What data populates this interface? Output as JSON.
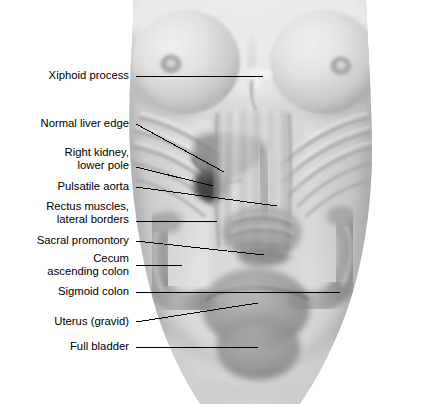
{
  "figure": {
    "type": "anatomical-illustration",
    "view": "anterior",
    "background_color": "#ffffff",
    "style": "grayscale airbrush medical illustration with translucent overlay of internal organs",
    "width": 431,
    "height": 404
  },
  "palette": {
    "background": "#ffffff",
    "skin_light": "#ededed",
    "skin_mid": "#d9d9d9",
    "skin_shadow": "#b9b9b9",
    "skin_deep_shadow": "#9a9a9a",
    "organ_overlay": "#a8a8a8",
    "organ_dark": "#6e6e6e",
    "kidney_dark": "#3a3a3a",
    "bone_highlight": "#f4f4f4",
    "areola": "#b0b0b0",
    "leader_line": "#000000",
    "label_text": "#000000"
  },
  "labels": [
    {
      "id": "xiphoid-process",
      "text": "Xiphoid process",
      "lines": [
        "Xiphoid process"
      ],
      "text_anchor_x": 129,
      "text_anchor_y": 69,
      "leader": {
        "x1": 136,
        "y1": 76,
        "x2": 263,
        "y2": 76
      },
      "target": "Xiphoid process of the sternum"
    },
    {
      "id": "normal-liver-edge",
      "text": "Normal liver edge",
      "lines": [
        "Normal liver edge"
      ],
      "text_anchor_x": 129,
      "text_anchor_y": 117,
      "leader": {
        "x1": 136,
        "y1": 124,
        "x2": 224,
        "y2": 172
      },
      "target": "Inferior border of the liver"
    },
    {
      "id": "right-kidney-lower-pole",
      "text": "Right kidney,\nlower pole",
      "lines": [
        "Right kidney,",
        "lower pole"
      ],
      "text_anchor_x": 129,
      "text_anchor_y": 146,
      "leader": {
        "x1": 136,
        "y1": 167,
        "x2": 213,
        "y2": 186
      },
      "target": "Lower pole of the right kidney"
    },
    {
      "id": "pulsatile-aorta",
      "text": "Pulsatile aorta",
      "lines": [
        "Pulsatile aorta"
      ],
      "text_anchor_x": 129,
      "text_anchor_y": 180,
      "leader": {
        "x1": 136,
        "y1": 187,
        "x2": 277,
        "y2": 206
      },
      "target": "Abdominal aorta"
    },
    {
      "id": "rectus-muscles-lateral-borders",
      "text": "Rectus muscles,\nlateral borders",
      "lines": [
        "Rectus muscles,",
        "lateral borders"
      ],
      "text_anchor_x": 129,
      "text_anchor_y": 200,
      "leader": {
        "x1": 136,
        "y1": 221,
        "x2": 217,
        "y2": 221
      },
      "target": "Lateral borders of the rectus abdominis muscles"
    },
    {
      "id": "sacral-promontory",
      "text": "Sacral promontory",
      "lines": [
        "Sacral promontory"
      ],
      "text_anchor_x": 129,
      "text_anchor_y": 234,
      "leader": {
        "x1": 136,
        "y1": 241,
        "x2": 264,
        "y2": 255
      },
      "target": "Sacral promontory"
    },
    {
      "id": "cecum-ascending-colon",
      "text": "Cecum\nascending colon",
      "lines": [
        "Cecum",
        "ascending colon"
      ],
      "text_anchor_x": 129,
      "text_anchor_y": 252,
      "leader": {
        "x1": 136,
        "y1": 265,
        "x2": 182,
        "y2": 265
      },
      "target": "Cecum and ascending colon"
    },
    {
      "id": "sigmoid-colon",
      "text": "Sigmoid colon",
      "lines": [
        "Sigmoid colon"
      ],
      "text_anchor_x": 129,
      "text_anchor_y": 285,
      "leader": {
        "x1": 136,
        "y1": 292,
        "x2": 340,
        "y2": 292
      },
      "target": "Sigmoid colon"
    },
    {
      "id": "uterus-gravid",
      "text": "Uterus (gravid)",
      "lines": [
        "Uterus (gravid)"
      ],
      "text_anchor_x": 129,
      "text_anchor_y": 315,
      "leader": {
        "x1": 136,
        "y1": 322,
        "x2": 258,
        "y2": 303
      },
      "target": "Gravid uterus"
    },
    {
      "id": "full-bladder",
      "text": "Full bladder",
      "lines": [
        "Full bladder"
      ],
      "text_anchor_x": 129,
      "text_anchor_y": 340,
      "leader": {
        "x1": 136,
        "y1": 347,
        "x2": 258,
        "y2": 347
      },
      "target": "Distended urinary bladder"
    }
  ]
}
